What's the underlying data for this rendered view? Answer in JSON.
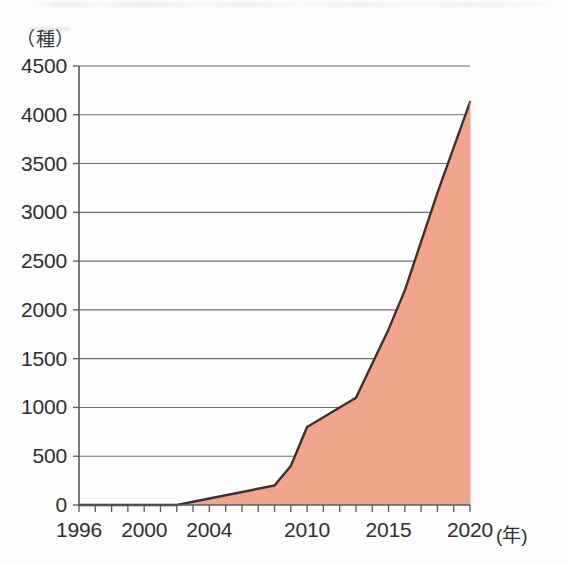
{
  "chart_data": {
    "type": "area",
    "title": "",
    "subtitle": "",
    "xlabel": "年",
    "ylabel": "種",
    "y_unit_label": "（種）",
    "x_unit_label": "(年)",
    "xlim": [
      1996,
      2020
    ],
    "ylim": [
      0,
      4500
    ],
    "grid": true,
    "legend": "none",
    "x_tick_labels": [
      "1996",
      "2000",
      "2004",
      "2010",
      "2015",
      "2020"
    ],
    "x_tick_values": [
      1996,
      2000,
      2004,
      2010,
      2015,
      2020
    ],
    "y_tick_labels": [
      "0",
      "500",
      "1000",
      "1500",
      "2000",
      "2500",
      "3000",
      "3500",
      "4000",
      "4500"
    ],
    "y_tick_values": [
      0,
      500,
      1000,
      1500,
      2000,
      2500,
      3000,
      3500,
      4000,
      4500
    ],
    "series": [
      {
        "name": "種数",
        "x": [
          1996,
          2002,
          2008,
          2009,
          2010,
          2012,
          2013,
          2015,
          2016,
          2018,
          2020
        ],
        "values": [
          0,
          0,
          200,
          400,
          800,
          1000,
          1100,
          1800,
          2200,
          3200,
          4130
        ],
        "fill_color": "#F2A58D",
        "line_color": "#3a3230"
      }
    ],
    "axis_color": "#5a5a5a",
    "grid_color": "#6e6e6e",
    "peak_value": 4130,
    "peak_year": 2020
  },
  "plot_geometry": {
    "left": 79,
    "right": 470,
    "top": 66,
    "bottom": 505
  }
}
